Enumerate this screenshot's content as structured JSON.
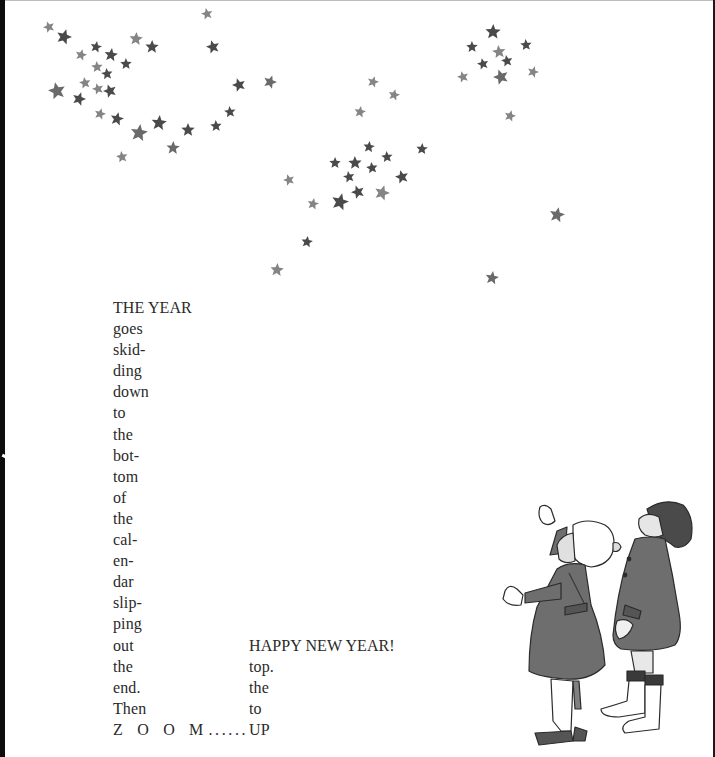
{
  "page": {
    "background": "#ffffff",
    "text_color": "#2a2a2a",
    "star_colors": {
      "dark": "#4a4a4a",
      "mid": "#6a6a6a",
      "light": "#858585"
    }
  },
  "poem": {
    "left_column": [
      "THE YEAR",
      "goes",
      "skid-",
      "ding",
      "down",
      "to",
      "the",
      "bot-",
      "tom",
      "of",
      "the",
      "cal-",
      "en-",
      "dar",
      "slip-",
      "ping",
      "out",
      "the",
      "end.",
      "Then"
    ],
    "zoom_word": "Z O O M",
    "zoom_dots": "......",
    "right_column": [
      "HAPPY NEW YEAR!",
      "top.",
      "the",
      "to",
      "UP"
    ]
  },
  "stars": [
    {
      "x": 49,
      "y": 27,
      "r": 6,
      "tone": "light"
    },
    {
      "x": 64,
      "y": 37,
      "r": 8,
      "tone": "dark"
    },
    {
      "x": 81,
      "y": 55,
      "r": 6,
      "tone": "light"
    },
    {
      "x": 96,
      "y": 47,
      "r": 6,
      "tone": "dark"
    },
    {
      "x": 111,
      "y": 55,
      "r": 7,
      "tone": "dark"
    },
    {
      "x": 136,
      "y": 39,
      "r": 7,
      "tone": "light"
    },
    {
      "x": 152,
      "y": 47,
      "r": 7,
      "tone": "dark"
    },
    {
      "x": 126,
      "y": 64,
      "r": 6,
      "tone": "dark"
    },
    {
      "x": 97,
      "y": 67,
      "r": 6,
      "tone": "light"
    },
    {
      "x": 107,
      "y": 74,
      "r": 6,
      "tone": "dark"
    },
    {
      "x": 85,
      "y": 83,
      "r": 6,
      "tone": "light"
    },
    {
      "x": 57,
      "y": 91,
      "r": 9,
      "tone": "mid"
    },
    {
      "x": 98,
      "y": 89,
      "r": 6,
      "tone": "light"
    },
    {
      "x": 110,
      "y": 91,
      "r": 7,
      "tone": "dark"
    },
    {
      "x": 79,
      "y": 99,
      "r": 7,
      "tone": "dark"
    },
    {
      "x": 100,
      "y": 114,
      "r": 6,
      "tone": "light"
    },
    {
      "x": 117,
      "y": 119,
      "r": 7,
      "tone": "dark"
    },
    {
      "x": 139,
      "y": 133,
      "r": 9,
      "tone": "mid"
    },
    {
      "x": 159,
      "y": 123,
      "r": 8,
      "tone": "dark"
    },
    {
      "x": 173,
      "y": 148,
      "r": 7,
      "tone": "mid"
    },
    {
      "x": 188,
      "y": 130,
      "r": 7,
      "tone": "dark"
    },
    {
      "x": 216,
      "y": 126,
      "r": 6,
      "tone": "dark"
    },
    {
      "x": 230,
      "y": 112,
      "r": 6,
      "tone": "dark"
    },
    {
      "x": 122,
      "y": 157,
      "r": 6,
      "tone": "light"
    },
    {
      "x": 207,
      "y": 14,
      "r": 6,
      "tone": "light"
    },
    {
      "x": 213,
      "y": 47,
      "r": 7,
      "tone": "dark"
    },
    {
      "x": 239,
      "y": 85,
      "r": 7,
      "tone": "dark"
    },
    {
      "x": 270,
      "y": 82,
      "r": 7,
      "tone": "mid"
    },
    {
      "x": 373,
      "y": 82,
      "r": 6,
      "tone": "light"
    },
    {
      "x": 394,
      "y": 95,
      "r": 6,
      "tone": "light"
    },
    {
      "x": 360,
      "y": 112,
      "r": 6,
      "tone": "light"
    },
    {
      "x": 369,
      "y": 147,
      "r": 6,
      "tone": "dark"
    },
    {
      "x": 422,
      "y": 149,
      "r": 6,
      "tone": "dark"
    },
    {
      "x": 335,
      "y": 163,
      "r": 6,
      "tone": "dark"
    },
    {
      "x": 355,
      "y": 163,
      "r": 7,
      "tone": "dark"
    },
    {
      "x": 387,
      "y": 157,
      "r": 6,
      "tone": "dark"
    },
    {
      "x": 372,
      "y": 168,
      "r": 6,
      "tone": "dark"
    },
    {
      "x": 349,
      "y": 177,
      "r": 6,
      "tone": "dark"
    },
    {
      "x": 402,
      "y": 177,
      "r": 7,
      "tone": "dark"
    },
    {
      "x": 289,
      "y": 180,
      "r": 6,
      "tone": "light"
    },
    {
      "x": 358,
      "y": 192,
      "r": 7,
      "tone": "dark"
    },
    {
      "x": 382,
      "y": 193,
      "r": 8,
      "tone": "light"
    },
    {
      "x": 340,
      "y": 202,
      "r": 9,
      "tone": "dark"
    },
    {
      "x": 313,
      "y": 204,
      "r": 6,
      "tone": "light"
    },
    {
      "x": 307,
      "y": 242,
      "r": 6,
      "tone": "dark"
    },
    {
      "x": 277,
      "y": 270,
      "r": 7,
      "tone": "light"
    },
    {
      "x": 493,
      "y": 32,
      "r": 8,
      "tone": "dark"
    },
    {
      "x": 472,
      "y": 47,
      "r": 6,
      "tone": "dark"
    },
    {
      "x": 526,
      "y": 45,
      "r": 6,
      "tone": "dark"
    },
    {
      "x": 499,
      "y": 52,
      "r": 7,
      "tone": "light"
    },
    {
      "x": 507,
      "y": 61,
      "r": 6,
      "tone": "dark"
    },
    {
      "x": 483,
      "y": 64,
      "r": 6,
      "tone": "dark"
    },
    {
      "x": 463,
      "y": 77,
      "r": 6,
      "tone": "light"
    },
    {
      "x": 501,
      "y": 77,
      "r": 8,
      "tone": "mid"
    },
    {
      "x": 533,
      "y": 72,
      "r": 6,
      "tone": "light"
    },
    {
      "x": 510,
      "y": 116,
      "r": 6,
      "tone": "light"
    },
    {
      "x": 557,
      "y": 215,
      "r": 8,
      "tone": "mid"
    },
    {
      "x": 492,
      "y": 278,
      "r": 7,
      "tone": "mid"
    }
  ],
  "illustration": {
    "subject": "two children in winter coats looking up at the stars",
    "coat_color": "#6e6e6e",
    "outline_color": "#2b2b2b"
  }
}
